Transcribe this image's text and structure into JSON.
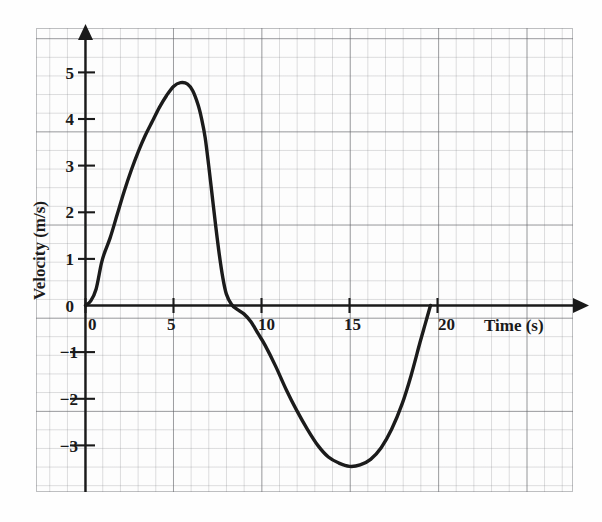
{
  "chart_data": {
    "type": "line",
    "title": "",
    "xlabel": "Time (s)",
    "ylabel": "Velocity (m/s)",
    "xlim": [
      -0.6,
      26.0
    ],
    "ylim": [
      -4.3,
      5.9
    ],
    "xticks": [
      0,
      5,
      10,
      15,
      20
    ],
    "xtick_labels": [
      "0",
      "5",
      "10",
      "15",
      "20"
    ],
    "yticks": [
      5,
      4,
      3,
      2,
      1,
      0,
      -1,
      -2,
      -3
    ],
    "ytick_labels": [
      "5",
      "4",
      "3",
      "2",
      "1",
      "0",
      "−1",
      "−2",
      "−3"
    ],
    "grid": true,
    "grid_style": "graph-paper",
    "legend": "none",
    "series": [
      {
        "name": "velocity",
        "x": [
          0.0,
          0.3,
          0.6,
          0.9,
          1.1,
          1.4,
          1.8,
          2.2,
          2.6,
          3.0,
          3.4,
          3.8,
          4.2,
          4.6,
          5.0,
          5.4,
          5.8,
          6.1,
          6.4,
          6.6,
          6.8,
          7.0,
          7.2,
          7.4,
          7.6,
          7.8,
          8.0,
          8.3,
          8.6,
          9.0,
          9.4,
          9.8,
          10.2,
          10.8,
          11.4,
          12.0,
          12.6,
          13.2,
          13.8,
          14.4,
          15.0,
          15.6,
          16.2,
          16.8,
          17.4,
          18.0,
          18.5,
          19.0,
          19.3,
          19.6
        ],
        "y": [
          0.0,
          0.1,
          0.35,
          0.9,
          1.15,
          1.45,
          1.95,
          2.45,
          2.9,
          3.3,
          3.65,
          3.95,
          4.25,
          4.5,
          4.7,
          4.78,
          4.75,
          4.6,
          4.3,
          4.0,
          3.6,
          3.0,
          2.35,
          1.7,
          1.1,
          0.6,
          0.25,
          0.02,
          -0.08,
          -0.18,
          -0.35,
          -0.6,
          -0.85,
          -1.3,
          -1.8,
          -2.25,
          -2.65,
          -3.0,
          -3.25,
          -3.38,
          -3.45,
          -3.42,
          -3.3,
          -3.05,
          -2.65,
          -2.1,
          -1.5,
          -0.8,
          -0.4,
          0.0
        ]
      }
    ],
    "annotations": {
      "peak_time": 5.5,
      "peak_value": 4.78,
      "zero_crossing_down": 8.1,
      "trough_time": 15.0,
      "trough_value": -3.45,
      "zero_crossing_up": 19.6
    }
  },
  "axes": {
    "x_arrow": true,
    "y_arrow": true,
    "origin_label": "0"
  }
}
